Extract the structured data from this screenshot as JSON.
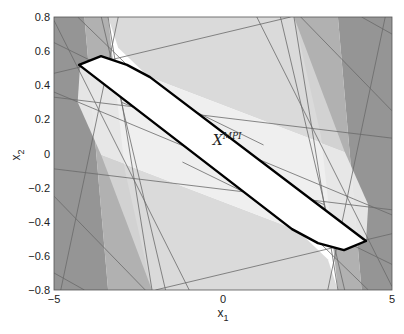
{
  "chart_data": {
    "type": "area",
    "title": "",
    "xlabel": "x",
    "xlabel_sub": "1",
    "ylabel": "x",
    "ylabel_sub": "2",
    "xlim": [
      -5,
      5
    ],
    "ylim": [
      -0.8,
      0.8
    ],
    "xticks": [
      -5,
      0,
      5
    ],
    "yticks": [
      -0.8,
      -0.6,
      -0.4,
      -0.2,
      0,
      0.2,
      0.4,
      0.6,
      0.8
    ],
    "grid": false,
    "annotation": {
      "text": "X",
      "superscript": "MPI",
      "x": -0.3,
      "y": 0.05
    },
    "mpi_polygon": [
      [
        -4.26,
        0.519
      ],
      [
        -3.61,
        0.571
      ],
      [
        -2.84,
        0.519
      ],
      [
        -2.16,
        0.448
      ],
      [
        4.23,
        -0.513
      ],
      [
        3.58,
        -0.566
      ],
      [
        2.81,
        -0.525
      ],
      [
        2.04,
        -0.443
      ]
    ],
    "constraint_regions": [
      {
        "name": "left-dark",
        "fill": "#8a8a8a",
        "points": [
          [
            -5,
            0.8
          ],
          [
            -4.1,
            0.8
          ],
          [
            -3.4,
            -0.8
          ],
          [
            -5,
            -0.8
          ]
        ]
      },
      {
        "name": "left-mid",
        "fill": "#a9a9a9",
        "points": [
          [
            -4.1,
            0.8
          ],
          [
            -3.4,
            0.8
          ],
          [
            -2.9,
            -0.1
          ],
          [
            -2.1,
            -0.8
          ],
          [
            -3.4,
            -0.8
          ]
        ]
      },
      {
        "name": "right-dark",
        "fill": "#8a8a8a",
        "points": [
          [
            5,
            -0.8
          ],
          [
            4.1,
            -0.8
          ],
          [
            3.4,
            0.8
          ],
          [
            5,
            0.8
          ]
        ]
      },
      {
        "name": "right-mid",
        "fill": "#a9a9a9",
        "points": [
          [
            4.1,
            -0.8
          ],
          [
            3.4,
            -0.8
          ],
          [
            2.9,
            0.1
          ],
          [
            2.1,
            0.8
          ],
          [
            3.4,
            0.8
          ]
        ]
      },
      {
        "name": "top-light",
        "fill": "#d6d6d6",
        "points": [
          [
            -3.4,
            0.8
          ],
          [
            2.1,
            0.8
          ],
          [
            3.6,
            0.01
          ],
          [
            -2.2,
            0.45
          ],
          [
            -3.1,
            0.62
          ]
        ]
      },
      {
        "name": "bottom-light",
        "fill": "#d6d6d6",
        "points": [
          [
            3.4,
            -0.8
          ],
          [
            -2.1,
            -0.8
          ],
          [
            -3.6,
            -0.01
          ],
          [
            2.2,
            -0.45
          ],
          [
            3.1,
            -0.62
          ]
        ]
      },
      {
        "name": "top-lightest",
        "fill": "#ededed",
        "points": [
          [
            -2.2,
            0.45
          ],
          [
            3.6,
            0.01
          ],
          [
            4.3,
            -0.3
          ],
          [
            4.23,
            -0.513
          ]
        ]
      },
      {
        "name": "bottom-lightest",
        "fill": "#ededed",
        "points": [
          [
            2.2,
            -0.45
          ],
          [
            -3.6,
            -0.01
          ],
          [
            -4.3,
            0.3
          ],
          [
            -4.23,
            0.513
          ]
        ]
      }
    ],
    "constraint_lines": [
      [
        [
          -5,
          0.78
        ],
        [
          -1.0,
          -0.8
        ]
      ],
      [
        [
          -5,
          0.65
        ],
        [
          1.2,
          0.05
        ]
      ],
      [
        [
          -5,
          0.47
        ],
        [
          2.0,
          0.8
        ]
      ],
      [
        [
          -5,
          0.36
        ],
        [
          3.0,
          -0.3
        ]
      ],
      [
        [
          -5,
          -0.09
        ],
        [
          5,
          -0.33
        ]
      ],
      [
        [
          -5,
          -0.25
        ],
        [
          -2.3,
          -0.8
        ]
      ],
      [
        [
          -5,
          -0.7
        ],
        [
          -4.1,
          -0.8
        ]
      ],
      [
        [
          -4.3,
          0.8
        ],
        [
          -0.4,
          0.05
        ]
      ],
      [
        [
          -3.1,
          0.8
        ],
        [
          -4.8,
          -0.8
        ]
      ],
      [
        [
          -3.4,
          0.8
        ],
        [
          -2.1,
          -0.8
        ]
      ],
      [
        [
          -3.6,
          0.8
        ],
        [
          -1.7,
          -0.8
        ]
      ],
      [
        [
          5,
          -0.78
        ],
        [
          1.0,
          0.8
        ]
      ],
      [
        [
          5,
          -0.65
        ],
        [
          -1.2,
          -0.05
        ]
      ],
      [
        [
          5,
          -0.47
        ],
        [
          -2.0,
          -0.8
        ]
      ],
      [
        [
          5,
          -0.36
        ],
        [
          -3.0,
          0.3
        ]
      ],
      [
        [
          5,
          0.09
        ],
        [
          -5,
          0.33
        ]
      ],
      [
        [
          5,
          0.25
        ],
        [
          2.3,
          0.8
        ]
      ],
      [
        [
          5,
          0.7
        ],
        [
          4.1,
          0.8
        ]
      ],
      [
        [
          4.3,
          -0.8
        ],
        [
          0.4,
          -0.05
        ]
      ],
      [
        [
          3.1,
          -0.8
        ],
        [
          4.8,
          0.8
        ]
      ],
      [
        [
          3.4,
          -0.8
        ],
        [
          2.1,
          0.8
        ]
      ],
      [
        [
          3.6,
          -0.8
        ],
        [
          1.7,
          0.8
        ]
      ]
    ]
  },
  "axes": {
    "xtick_labels": [
      "−5",
      "0",
      "5"
    ],
    "ytick_labels": [
      "0.8",
      "0.6",
      "0.4",
      "0.2",
      "0",
      "−0.2",
      "−0.4",
      "−0.6",
      "−0.8"
    ]
  }
}
